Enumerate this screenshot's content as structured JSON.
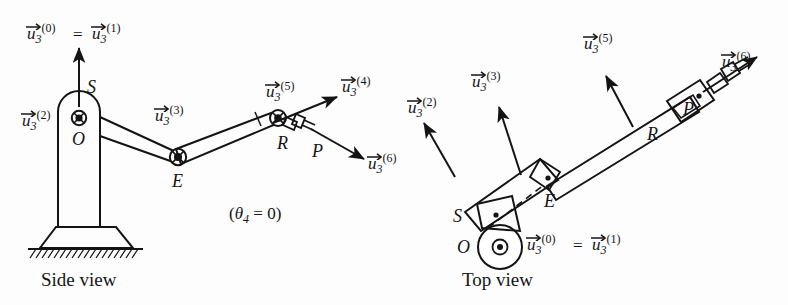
{
  "figure": {
    "background_color": "#fdfdfd",
    "ink_color": "#141414"
  },
  "side_view": {
    "caption": "Side view",
    "annotation": {
      "open_paren": "(",
      "theta": "θ",
      "subscript": "4",
      "equals": " = ",
      "value": "0",
      "close_paren": ")",
      "full_text": "(θ4 = 0)"
    },
    "points": [
      {
        "name": "shoulder",
        "label": "S"
      },
      {
        "name": "origin",
        "label": "O",
        "marker": "circle-cross"
      },
      {
        "name": "elbow",
        "label": "E",
        "marker": "circle-cross"
      },
      {
        "name": "wrist",
        "label": "R",
        "marker": "circle-cross"
      },
      {
        "name": "end-effector",
        "label": "P"
      }
    ],
    "vectors": [
      {
        "name": "u3-0",
        "symbol": "u",
        "subscript": "3",
        "superscript": "(0)"
      },
      {
        "name": "u3-1",
        "symbol": "u",
        "subscript": "3",
        "superscript": "(1)"
      },
      {
        "name": "u3-2",
        "symbol": "u",
        "subscript": "3",
        "superscript": "(2)"
      },
      {
        "name": "u3-3",
        "symbol": "u",
        "subscript": "3",
        "superscript": "(3)"
      },
      {
        "name": "u3-4",
        "symbol": "u",
        "subscript": "3",
        "superscript": "(4)"
      },
      {
        "name": "u3-5",
        "symbol": "u",
        "subscript": "3",
        "superscript": "(5)"
      },
      {
        "name": "u3-6",
        "symbol": "u",
        "subscript": "3",
        "superscript": "(6)"
      }
    ],
    "equals_sign": "="
  },
  "top_view": {
    "caption": "Top view",
    "points": [
      {
        "name": "shoulder",
        "label": "S",
        "marker": "dot"
      },
      {
        "name": "origin",
        "label": "O",
        "marker": "circle-dot"
      },
      {
        "name": "elbow",
        "label": "E",
        "marker": "dot"
      },
      {
        "name": "wrist",
        "label": "R",
        "marker": "dot"
      },
      {
        "name": "end-effector",
        "label": "P"
      }
    ],
    "vectors": [
      {
        "name": "u3-0",
        "symbol": "u",
        "subscript": "3",
        "superscript": "(0)"
      },
      {
        "name": "u3-1",
        "symbol": "u",
        "subscript": "3",
        "superscript": "(1)"
      },
      {
        "name": "u3-2",
        "symbol": "u",
        "subscript": "3",
        "superscript": "(2)"
      },
      {
        "name": "u3-3",
        "symbol": "u",
        "subscript": "3",
        "superscript": "(3)"
      },
      {
        "name": "u3-5",
        "symbol": "u",
        "subscript": "3",
        "superscript": "(5)"
      },
      {
        "name": "u3-6",
        "symbol": "u",
        "subscript": "3",
        "superscript": "(6)"
      }
    ],
    "equals_sign": "="
  },
  "glyphs": {
    "u_letter": "u",
    "three": "3",
    "sup0": "(0)",
    "sup1": "(1)",
    "sup2": "(2)",
    "sup3": "(3)",
    "sup4": "(4)",
    "sup5": "(5)",
    "sup6": "(6)"
  }
}
